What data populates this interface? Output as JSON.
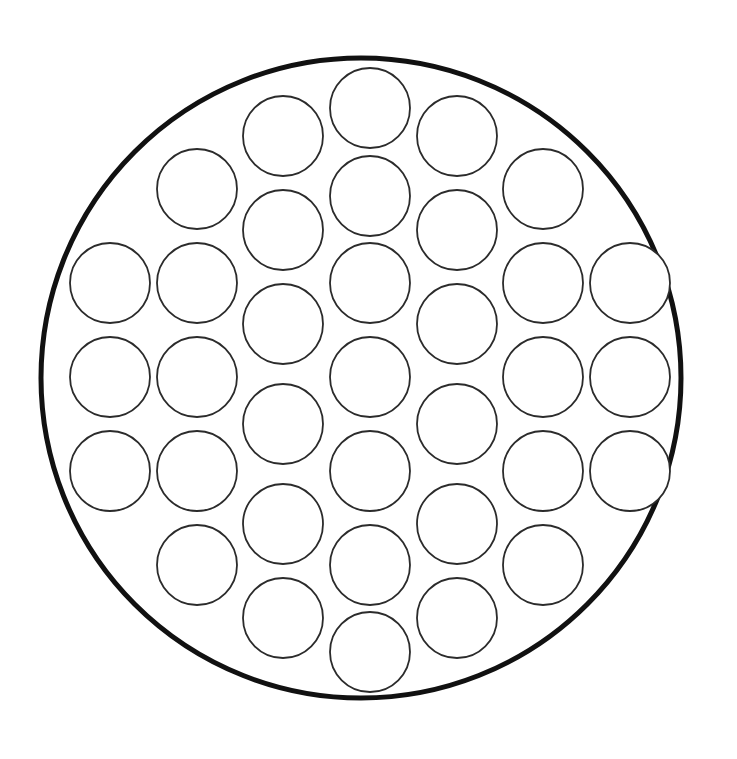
{
  "canvas": {
    "width": 737,
    "height": 759,
    "background_color": "#ffffff"
  },
  "diagram": {
    "type": "circle-packing",
    "title": ""
  },
  "chart_data": {
    "type": "scatter",
    "title": "",
    "subtitle": "",
    "xlabel": "",
    "ylabel": "",
    "grid": false,
    "legend": null,
    "xlim": [
      0,
      737
    ],
    "ylim": [
      0,
      759
    ],
    "boundary": {
      "name": "outer-circle",
      "shape": "circle",
      "cx": 361,
      "cy": 378,
      "r": 320,
      "stroke_color": "#111111",
      "stroke_width": 5,
      "fill_color": "#ffffff"
    },
    "packing": {
      "lattice": "hexagonal",
      "circle_radius": 40,
      "x_pitch": 87,
      "y_pitch": 94,
      "column_y_offset": 47,
      "count": 35,
      "stroke_color": "#2b2b2b",
      "stroke_width": 1.8,
      "fill_color": "#ffffff"
    },
    "circles": [
      {
        "id": 1,
        "cx": 110,
        "cy": 283,
        "r": 40
      },
      {
        "id": 2,
        "cx": 110,
        "cy": 377,
        "r": 40
      },
      {
        "id": 3,
        "cx": 110,
        "cy": 471,
        "r": 40
      },
      {
        "id": 4,
        "cx": 197,
        "cy": 189,
        "r": 40
      },
      {
        "id": 5,
        "cx": 197,
        "cy": 283,
        "r": 40
      },
      {
        "id": 6,
        "cx": 197,
        "cy": 377,
        "r": 40
      },
      {
        "id": 7,
        "cx": 197,
        "cy": 471,
        "r": 40
      },
      {
        "id": 8,
        "cx": 197,
        "cy": 565,
        "r": 40
      },
      {
        "id": 9,
        "cx": 283,
        "cy": 136,
        "r": 40
      },
      {
        "id": 10,
        "cx": 283,
        "cy": 230,
        "r": 40
      },
      {
        "id": 11,
        "cx": 283,
        "cy": 324,
        "r": 40
      },
      {
        "id": 12,
        "cx": 283,
        "cy": 424,
        "r": 40
      },
      {
        "id": 13,
        "cx": 283,
        "cy": 524,
        "r": 40
      },
      {
        "id": 14,
        "cx": 283,
        "cy": 618,
        "r": 40
      },
      {
        "id": 15,
        "cx": 370,
        "cy": 108,
        "r": 40
      },
      {
        "id": 16,
        "cx": 370,
        "cy": 196,
        "r": 40
      },
      {
        "id": 17,
        "cx": 370,
        "cy": 283,
        "r": 40
      },
      {
        "id": 18,
        "cx": 370,
        "cy": 377,
        "r": 40
      },
      {
        "id": 19,
        "cx": 370,
        "cy": 471,
        "r": 40
      },
      {
        "id": 20,
        "cx": 370,
        "cy": 565,
        "r": 40
      },
      {
        "id": 21,
        "cx": 370,
        "cy": 652,
        "r": 40
      },
      {
        "id": 22,
        "cx": 457,
        "cy": 136,
        "r": 40
      },
      {
        "id": 23,
        "cx": 457,
        "cy": 230,
        "r": 40
      },
      {
        "id": 24,
        "cx": 457,
        "cy": 324,
        "r": 40
      },
      {
        "id": 25,
        "cx": 457,
        "cy": 424,
        "r": 40
      },
      {
        "id": 26,
        "cx": 457,
        "cy": 524,
        "r": 40
      },
      {
        "id": 27,
        "cx": 457,
        "cy": 618,
        "r": 40
      },
      {
        "id": 28,
        "cx": 543,
        "cy": 189,
        "r": 40
      },
      {
        "id": 29,
        "cx": 543,
        "cy": 283,
        "r": 40
      },
      {
        "id": 30,
        "cx": 543,
        "cy": 377,
        "r": 40
      },
      {
        "id": 31,
        "cx": 543,
        "cy": 471,
        "r": 40
      },
      {
        "id": 32,
        "cx": 543,
        "cy": 565,
        "r": 40
      },
      {
        "id": 33,
        "cx": 630,
        "cy": 283,
        "r": 40
      },
      {
        "id": 34,
        "cx": 630,
        "cy": 377,
        "r": 40
      },
      {
        "id": 35,
        "cx": 630,
        "cy": 471,
        "r": 40
      }
    ]
  }
}
